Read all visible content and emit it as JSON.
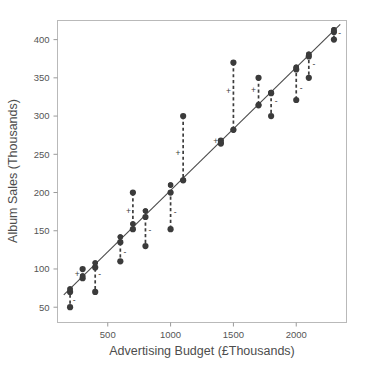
{
  "chart_data": {
    "type": "scatter",
    "title": "",
    "subtitle": "",
    "xlabel": "Advertising Budget (£Thousands)",
    "ylabel": "Album Sales (Thousands)",
    "xlim": [
      100,
      2400
    ],
    "ylim": [
      30,
      425
    ],
    "xticks": [
      500,
      1000,
      1500,
      2000
    ],
    "xtick_labels": [
      "500",
      "1000",
      "1500",
      "2000"
    ],
    "yticks": [
      50,
      100,
      150,
      200,
      250,
      300,
      350,
      400
    ],
    "ytick_labels": [
      "50",
      "100",
      "150",
      "200",
      "250",
      "300",
      "350",
      "400"
    ],
    "grid": false,
    "legend": null,
    "series": [
      {
        "name": "Observed album sales",
        "type": "scatter",
        "marker": "filled-circle",
        "color": "#3b3b3b",
        "points": [
          {
            "x": 200,
            "y": 70,
            "fitted": 74,
            "residual_sign": "-"
          },
          {
            "x": 200,
            "y": 50,
            "fitted": 74,
            "residual_sign": "-"
          },
          {
            "x": 300,
            "y": 100,
            "fitted": 91,
            "residual_sign": "+"
          },
          {
            "x": 300,
            "y": 88,
            "fitted": 91,
            "residual_sign": "+"
          },
          {
            "x": 400,
            "y": 102,
            "fitted": 108,
            "residual_sign": "-"
          },
          {
            "x": 400,
            "y": 70,
            "fitted": 108,
            "residual_sign": "-"
          },
          {
            "x": 600,
            "y": 135,
            "fitted": 142,
            "residual_sign": "-"
          },
          {
            "x": 600,
            "y": 110,
            "fitted": 142,
            "residual_sign": "-"
          },
          {
            "x": 700,
            "y": 200,
            "fitted": 159,
            "residual_sign": "+"
          },
          {
            "x": 700,
            "y": 152,
            "fitted": 159,
            "residual_sign": "+"
          },
          {
            "x": 800,
            "y": 168,
            "fitted": 176,
            "residual_sign": "-"
          },
          {
            "x": 800,
            "y": 130,
            "fitted": 176,
            "residual_sign": "-"
          },
          {
            "x": 1000,
            "y": 200,
            "fitted": 210,
            "residual_sign": "-"
          },
          {
            "x": 1000,
            "y": 152,
            "fitted": 210,
            "residual_sign": "-"
          },
          {
            "x": 1100,
            "y": 300,
            "fitted": 216,
            "residual_sign": "+"
          },
          {
            "x": 1100,
            "y": 216,
            "fitted": 216,
            "residual_sign": "+"
          },
          {
            "x": 1400,
            "y": 268,
            "fitted": 265,
            "residual_sign": "+"
          },
          {
            "x": 1400,
            "y": 264,
            "fitted": 265,
            "residual_sign": "+"
          },
          {
            "x": 1500,
            "y": 370,
            "fitted": 282,
            "residual_sign": "+"
          },
          {
            "x": 1500,
            "y": 282,
            "fitted": 282,
            "residual_sign": "+"
          },
          {
            "x": 1700,
            "y": 350,
            "fitted": 315,
            "residual_sign": "+"
          },
          {
            "x": 1700,
            "y": 314,
            "fitted": 315,
            "residual_sign": "+"
          },
          {
            "x": 1800,
            "y": 330,
            "fitted": 331,
            "residual_sign": "-"
          },
          {
            "x": 1800,
            "y": 300,
            "fitted": 331,
            "residual_sign": "-"
          },
          {
            "x": 2000,
            "y": 361,
            "fitted": 364,
            "residual_sign": "-"
          },
          {
            "x": 2000,
            "y": 321,
            "fitted": 364,
            "residual_sign": "-"
          },
          {
            "x": 2100,
            "y": 378,
            "fitted": 381,
            "residual_sign": "-"
          },
          {
            "x": 2100,
            "y": 350,
            "fitted": 381,
            "residual_sign": "-"
          },
          {
            "x": 2300,
            "y": 410,
            "fitted": 413,
            "residual_sign": "-"
          },
          {
            "x": 2300,
            "y": 400,
            "fitted": 413,
            "residual_sign": "-"
          }
        ]
      },
      {
        "name": "Regression line (model fit)",
        "type": "line",
        "color": "#4a4a4a",
        "endpoints": [
          {
            "x": 150,
            "y": 66
          },
          {
            "x": 2350,
            "y": 420
          }
        ]
      }
    ],
    "residual_annotations": [
      {
        "x": 200,
        "y_top": 74,
        "y_bottom": 50,
        "sign": "-",
        "sign_x": 232,
        "sign_y": 60
      },
      {
        "x": 300,
        "y_top": 100,
        "y_bottom": 88,
        "sign": "+",
        "sign_x": 258,
        "sign_y": 94
      },
      {
        "x": 400,
        "y_top": 108,
        "y_bottom": 70,
        "sign": "-",
        "sign_x": 435,
        "sign_y": 94
      },
      {
        "x": 600,
        "y_top": 142,
        "y_bottom": 110,
        "sign": "-",
        "sign_x": 636,
        "sign_y": 122
      },
      {
        "x": 700,
        "y_top": 200,
        "y_bottom": 159,
        "sign": "+",
        "sign_x": 664,
        "sign_y": 176
      },
      {
        "x": 800,
        "y_top": 176,
        "y_bottom": 130,
        "sign": "-",
        "sign_x": 836,
        "sign_y": 151
      },
      {
        "x": 1000,
        "y_top": 210,
        "y_bottom": 152,
        "sign": "-",
        "sign_x": 1036,
        "sign_y": 174
      },
      {
        "x": 1100,
        "y_top": 300,
        "y_bottom": 216,
        "sign": "+",
        "sign_x": 1058,
        "sign_y": 252
      },
      {
        "x": 1400,
        "y_top": 268,
        "y_bottom": 264,
        "sign": "+",
        "sign_x": 1360,
        "sign_y": 268
      },
      {
        "x": 1500,
        "y_top": 370,
        "y_bottom": 282,
        "sign": "+",
        "sign_x": 1460,
        "sign_y": 333
      },
      {
        "x": 1700,
        "y_top": 350,
        "y_bottom": 314,
        "sign": "+",
        "sign_x": 1660,
        "sign_y": 334
      },
      {
        "x": 1800,
        "y_top": 331,
        "y_bottom": 300,
        "sign": "-",
        "sign_x": 1840,
        "sign_y": 320
      },
      {
        "x": 2000,
        "y_top": 364,
        "y_bottom": 321,
        "sign": "-",
        "sign_x": 2040,
        "sign_y": 337
      },
      {
        "x": 2100,
        "y_top": 381,
        "y_bottom": 350,
        "sign": "-",
        "sign_x": 2140,
        "sign_y": 368
      },
      {
        "x": 2300,
        "y_top": 413,
        "y_bottom": 400,
        "sign": "-",
        "sign_x": 2345,
        "sign_y": 409
      }
    ]
  }
}
